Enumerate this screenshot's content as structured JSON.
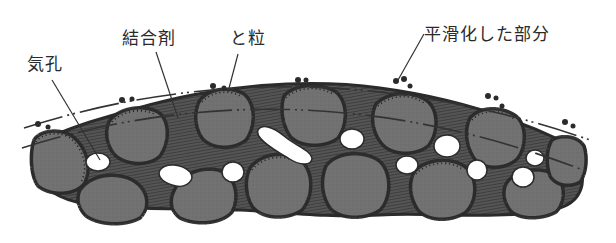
{
  "diagram": {
    "labels": {
      "pore": "気孔",
      "bond": "結合剤",
      "grain": "と粒",
      "smoothed": "平滑化した部分"
    },
    "colors": {
      "background": "#ffffff",
      "grain_fill": "#6e6e6e",
      "grain_outline": "#2b2b2b",
      "bond_fill": "#4a4a4a",
      "pore_fill": "#ffffff",
      "line": "#333333",
      "text": "#2a2a2a"
    }
  }
}
